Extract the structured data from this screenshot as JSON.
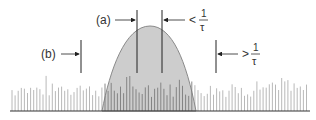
{
  "diagram": {
    "labels": {
      "a": "(a)",
      "b": "(b)",
      "lt_sym": "<",
      "gt_sym": ">",
      "frac_num": "1",
      "frac_den": "τ"
    },
    "colors": {
      "hump_fill": "#c4c4c4",
      "hump_stroke": "#8a8a8a",
      "spike": "#b0b0b0",
      "spike_inside": "#7c7c7c",
      "line": "#222222",
      "baseline": "#333333"
    }
  }
}
